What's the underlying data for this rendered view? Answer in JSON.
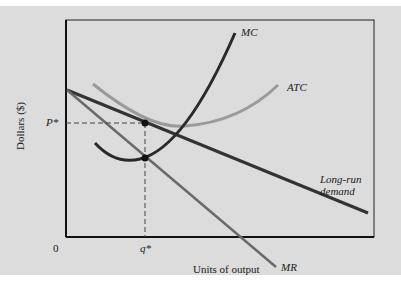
{
  "diagram": {
    "y_axis_label": "Dollars ($)",
    "x_axis_label": "Units of output",
    "origin_label": "0",
    "price_label": "P*",
    "quantity_label": "q*",
    "curves": {
      "mc": "MC",
      "atc": "ATC",
      "demand_line1": "Long-run",
      "demand_line2": "demand",
      "mr": "MR"
    },
    "colors": {
      "panel": "#dcdcdc",
      "mc": "#2a2a2a",
      "atc": "#9a9a9a",
      "demand": "#3a3a3a",
      "mr": "#6a6a6a",
      "axis": "#111111"
    }
  }
}
